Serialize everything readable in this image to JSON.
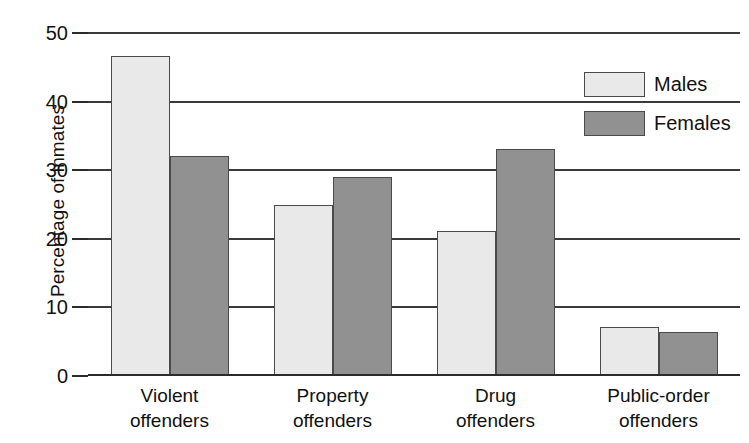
{
  "chart_data": {
    "type": "bar",
    "title": "",
    "xlabel": "",
    "ylabel": "Percentage of inmates",
    "ylim": [
      0,
      50
    ],
    "yticks": [
      0,
      10,
      20,
      30,
      40,
      50
    ],
    "ytick_labels": [
      "0",
      "10",
      "20",
      "30",
      "40",
      "50"
    ],
    "grid": true,
    "grid_axis": "y",
    "legend_position": "top-right",
    "categories": [
      "Violent offenders",
      "Property offenders",
      "Drug offenders",
      "Public-order offenders"
    ],
    "category_lines": [
      [
        "Violent",
        "offenders"
      ],
      [
        "Property",
        "offenders"
      ],
      [
        "Drug",
        "offenders"
      ],
      [
        "Public-order",
        "offenders"
      ]
    ],
    "series": [
      {
        "name": "Males",
        "color": "#e9e9e9",
        "values": [
          46.6,
          25.0,
          21.1,
          7.1
        ]
      },
      {
        "name": "Females",
        "color": "#919191",
        "values": [
          32.0,
          29.0,
          33.1,
          6.4
        ]
      }
    ]
  },
  "legend": {
    "items": [
      {
        "label": "Males",
        "color": "#e9e9e9"
      },
      {
        "label": "Females",
        "color": "#919191"
      }
    ]
  },
  "axes": {
    "y_title": "Percentage of inmates"
  }
}
